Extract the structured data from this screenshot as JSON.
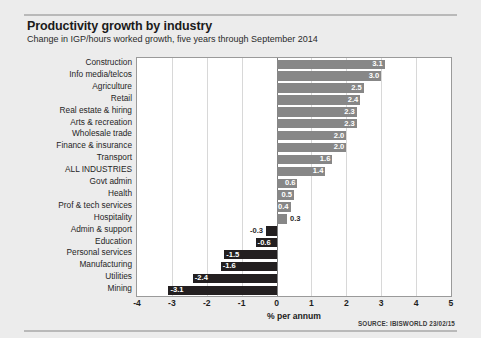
{
  "header": {
    "title": "Productivity growth by industry",
    "subtitle": "Change in IGP/hours worked growth, five years through September 2014"
  },
  "footer": {
    "source": "SOURCE: IBISWORLD 23/02/15"
  },
  "chart_data": {
    "type": "bar",
    "orientation": "horizontal",
    "title": "Productivity growth by industry",
    "subtitle": "Change in IGP/hours worked growth, five years through September 2014",
    "xlabel": "% per annum",
    "ylabel": "",
    "xlim": [
      -4,
      5
    ],
    "xticks": [
      "-4",
      "-3",
      "-2",
      "-1",
      "0",
      "1",
      "2",
      "3",
      "4",
      "5"
    ],
    "xtick_values": [
      -4,
      -3,
      -2,
      -1,
      0,
      1,
      2,
      3,
      4,
      5
    ],
    "grid": true,
    "legend": false,
    "zero_line": 0,
    "colors": {
      "positive": "#878787",
      "negative": "#231f20",
      "plot_background": "#ffffff",
      "card_background": "#ececec",
      "gridline": "#d8d8d8",
      "frame": "#9a9a9a"
    },
    "categories": [
      "Construction",
      "Info media/telcos",
      "Agriculture",
      "Retail",
      "Real estate & hiring",
      "Arts & recreation",
      "Wholesale trade",
      "Finance & insurance",
      "Transport",
      "ALL INDUSTRIES",
      "Govt admin",
      "Health",
      "Prof & tech services",
      "Hospitality",
      "Admin & support",
      "Education",
      "Personal services",
      "Manufacturing",
      "Utilities",
      "Mining"
    ],
    "values": [
      3.1,
      3.0,
      2.5,
      2.4,
      2.3,
      2.3,
      2.0,
      2.0,
      1.6,
      1.4,
      0.6,
      0.5,
      0.4,
      0.3,
      -0.3,
      -0.6,
      -1.5,
      -1.6,
      -2.4,
      -3.1
    ],
    "labels": [
      "3.1",
      "3.0",
      "2.5",
      "2.4",
      "2.3",
      "2.3",
      "2.0",
      "2.0",
      "1.6",
      "1.4",
      "0.6",
      "0.5",
      "0.4",
      "0.3",
      "-0.3",
      "-0.6",
      "-1.5",
      "-1.6",
      "-2.4",
      "-3.1"
    ],
    "label_placement": [
      "inside",
      "inside",
      "inside",
      "inside",
      "inside",
      "inside",
      "inside",
      "inside",
      "inside",
      "inside",
      "inside",
      "inside",
      "inside",
      "outside",
      "outside",
      "inside",
      "inside",
      "inside",
      "inside",
      "inside"
    ]
  }
}
